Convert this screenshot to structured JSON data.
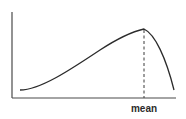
{
  "diagram": {
    "type": "left-skewed distribution curve",
    "marker_label": "mean",
    "colors": {
      "axis": "#4a4a4a",
      "curve": "#2b2b2b",
      "marker": "#3a3a3a",
      "background": "#ffffff"
    }
  }
}
